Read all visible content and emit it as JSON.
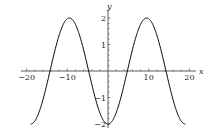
{
  "chart_data": {
    "type": "line",
    "title": "",
    "xlabel": "x",
    "ylabel": "y",
    "xlim": [
      -21,
      21
    ],
    "ylim": [
      -2.1,
      2.2
    ],
    "grid": false,
    "legend": null,
    "x_ticks": [
      -20,
      -10,
      10,
      20
    ],
    "x_tick_labels": [
      "−20",
      "−10",
      "10",
      "20"
    ],
    "y_ticks": [
      2,
      1,
      -1,
      -2
    ],
    "y_tick_labels": [
      "2",
      "1",
      "−1",
      "−2"
    ],
    "series": [
      {
        "name": "y = -2cos(2πx/19)",
        "function": "-2*cos(2*pi*x/19)",
        "x_range": [
          -19,
          19
        ],
        "color": "#000000",
        "x": [
          -19,
          -14.25,
          -9.5,
          -4.75,
          0,
          4.75,
          9.5,
          14.25,
          19
        ],
        "y": [
          -2,
          0,
          2,
          0,
          -2,
          0,
          2,
          0,
          -2
        ]
      }
    ]
  }
}
